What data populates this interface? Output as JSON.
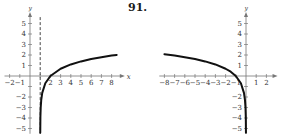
{
  "problem": {
    "number_label": "91."
  },
  "chart_data": [
    {
      "type": "line",
      "title": "",
      "xlabel": "x",
      "ylabel": "y",
      "function": "y = ln(x - 1)",
      "xlim": [
        -2.5,
        9
      ],
      "ylim": [
        -5.5,
        5.8
      ],
      "x_ticks": [
        -2,
        -1,
        1,
        2,
        3,
        4,
        5,
        6,
        7,
        8
      ],
      "x_tick_labels": [
        "-2",
        "-1",
        "2",
        "3",
        "4",
        "5",
        "6",
        "7",
        "8"
      ],
      "y_ticks": [
        -5,
        -4,
        -3,
        -2,
        -1,
        1,
        2,
        3,
        4,
        5
      ],
      "y_tick_labels": [
        "5",
        "4",
        "3",
        "2",
        "1",
        "-2",
        "-3",
        "-4",
        "-5"
      ],
      "asymptote": {
        "type": "vertical",
        "x": 1,
        "style": "dashed"
      },
      "grid": false,
      "series": [
        {
          "name": "curve",
          "x": [
            1.0045,
            1.02,
            1.05,
            1.1,
            1.2,
            1.5,
            2,
            3,
            4,
            5,
            6,
            7,
            8,
            8.5
          ],
          "y": [
            -5.4,
            -3.91,
            -3.0,
            -2.3,
            -1.61,
            -0.69,
            0,
            0.69,
            1.1,
            1.39,
            1.61,
            1.79,
            1.95,
            2.01
          ]
        }
      ]
    },
    {
      "type": "line",
      "title": "",
      "xlabel": "",
      "ylabel": "y",
      "function": "y = ln(-x)",
      "xlim": [
        -8.5,
        2.8
      ],
      "ylim": [
        -5.5,
        5.8
      ],
      "x_ticks": [
        -8,
        -7,
        -6,
        -5,
        -4,
        -3,
        -2,
        -1,
        1,
        2
      ],
      "x_tick_labels": [
        "-8",
        "-7",
        "-6",
        "-5",
        "-4",
        "-3",
        "-2",
        "-1",
        "1",
        "2"
      ],
      "y_ticks": [
        -5,
        -4,
        -3,
        -2,
        -1,
        1,
        2,
        3,
        4,
        5
      ],
      "y_tick_labels": [
        "5",
        "4",
        "3",
        "2",
        "1",
        "-2",
        "-3",
        "-4",
        "-5"
      ],
      "grid": false,
      "series": [
        {
          "name": "curve",
          "x": [
            -8,
            -7,
            -6,
            -5,
            -4,
            -3,
            -2,
            -1.5,
            -1,
            -0.5,
            -0.2,
            -0.1,
            -0.05,
            -0.02,
            -0.0045
          ],
          "y": [
            2.08,
            1.95,
            1.79,
            1.61,
            1.39,
            1.1,
            0.69,
            0.41,
            0,
            -0.69,
            -1.61,
            -2.3,
            -3.0,
            -3.91,
            -5.4
          ]
        }
      ]
    }
  ]
}
